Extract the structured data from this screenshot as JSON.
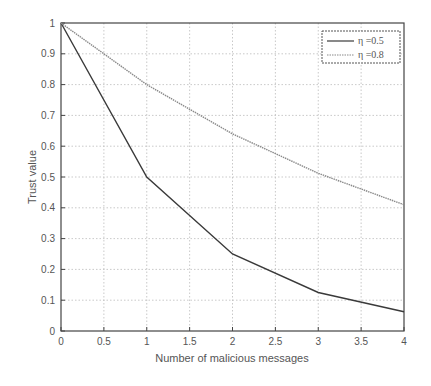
{
  "chart_data": {
    "type": "line",
    "title": "",
    "xlabel": "Number of  malicious messages",
    "ylabel": "Trust value",
    "xlim": [
      0,
      4
    ],
    "ylim": [
      0,
      1
    ],
    "grid": true,
    "legend_position": "upper right",
    "x": [
      0,
      1,
      2,
      3,
      4
    ],
    "xticks": [
      "0",
      "0.5",
      "1",
      "1.5",
      "2",
      "2.5",
      "3",
      "3.5",
      "4"
    ],
    "yticks": [
      "0",
      "0.1",
      "0.2",
      "0.3",
      "0.4",
      "0.5",
      "0.6",
      "0.7",
      "0.8",
      "0.9",
      "1"
    ],
    "series": [
      {
        "name": "η =0.5",
        "values": [
          1,
          0.5,
          0.25,
          0.125,
          0.0625
        ],
        "color": "#3a3a3a",
        "style": "solid"
      },
      {
        "name": "η =0.8",
        "values": [
          1,
          0.8,
          0.64,
          0.512,
          0.41
        ],
        "color": "#8a8a8a",
        "style": "dotted"
      }
    ]
  }
}
